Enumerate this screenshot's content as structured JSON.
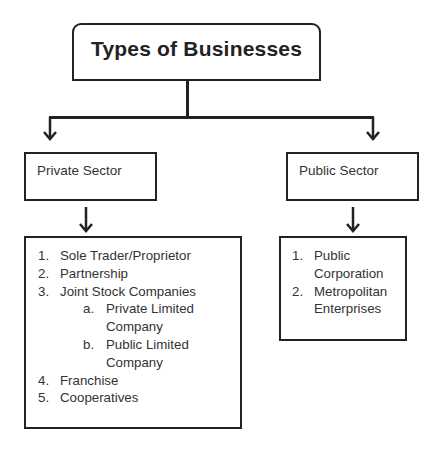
{
  "title": "Types of Businesses",
  "branches": [
    {
      "label": "Private Sector",
      "items": [
        {
          "num": "1.",
          "text": "Sole Trader/Proprietor",
          "level": 0
        },
        {
          "num": "2.",
          "text": "Partnership",
          "level": 0
        },
        {
          "num": "3.",
          "text": "Joint Stock Companies",
          "level": 0
        },
        {
          "num": "a.",
          "text": "Private Limited Company",
          "line1": "Private Limited",
          "line2": "Company",
          "level": 1
        },
        {
          "num": "b.",
          "text": "Public Limited Company",
          "line1": "Public Limited",
          "line2": "Company",
          "level": 1
        },
        {
          "num": "4.",
          "text": "Franchise",
          "level": 0
        },
        {
          "num": "5.",
          "text": "Cooperatives",
          "level": 0
        }
      ]
    },
    {
      "label": "Public Sector",
      "items": [
        {
          "num": "1.",
          "text": "Public Corporation",
          "line1": "Public",
          "line2": "Corporation",
          "level": 0
        },
        {
          "num": "2.",
          "text": "Metropolitan Enterprises",
          "line1": "Metropolitan",
          "line2": "Enterprises",
          "level": 0
        }
      ]
    }
  ],
  "colors": {
    "stroke": "#222222",
    "text": "#333333",
    "background": "#ffffff"
  }
}
